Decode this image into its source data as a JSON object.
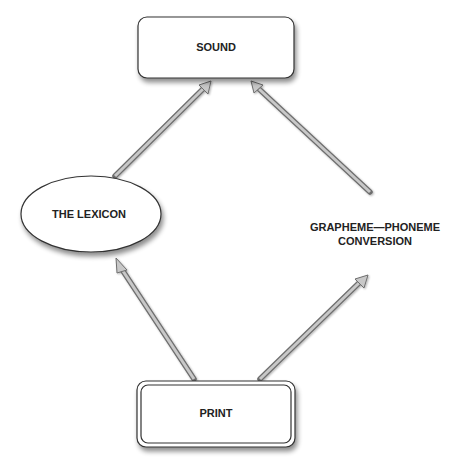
{
  "diagram": {
    "nodes": {
      "sound": {
        "label": "SOUND",
        "shape": "rounded-rect"
      },
      "lexicon": {
        "label": "THE LEXICON",
        "shape": "ellipse"
      },
      "gpc": {
        "line1": "GRAPHEME—PHONEME",
        "line2": "CONVERSION",
        "shape": "text"
      },
      "print": {
        "label": "PRINT",
        "shape": "double-rounded-rect"
      }
    },
    "edges": [
      {
        "from": "print",
        "to": "lexicon"
      },
      {
        "from": "lexicon",
        "to": "sound"
      },
      {
        "from": "print",
        "to": "gpc"
      },
      {
        "from": "gpc",
        "to": "sound"
      }
    ],
    "colors": {
      "stroke": "#333333",
      "arrow_fill": "#bdbdbd",
      "arrow_edge": "#6e6e6e",
      "node_fill": "#ffffff"
    }
  }
}
